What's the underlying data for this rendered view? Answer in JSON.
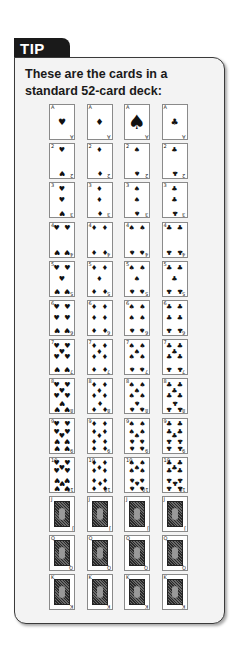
{
  "tip": {
    "tab_label": "TIP",
    "text": "These are the cards in a standard 52-card deck:"
  },
  "deck": {
    "suits": [
      {
        "name": "hearts",
        "symbol": "♥"
      },
      {
        "name": "diamonds",
        "symbol": "♦"
      },
      {
        "name": "spades",
        "symbol": "♠"
      },
      {
        "name": "clubs",
        "symbol": "♣"
      }
    ],
    "ranks": [
      "A",
      "2",
      "3",
      "4",
      "5",
      "6",
      "7",
      "8",
      "9",
      "10",
      "J",
      "Q",
      "K"
    ],
    "card_count": 52
  },
  "colors": {
    "tab_background": "#1a1a1a",
    "box_background": "#f3f3f3",
    "box_border": "#3a3a3a",
    "card_border": "#8a8a8a"
  }
}
